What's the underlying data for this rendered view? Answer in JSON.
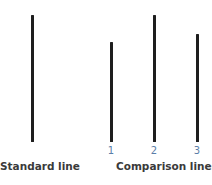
{
  "standard": {
    "caption": "Standard line",
    "line": {
      "x": 31,
      "top": 15,
      "bottom": 142
    }
  },
  "comparison": {
    "caption": "Comparison lines",
    "lines": [
      {
        "label": "1",
        "x": 110,
        "top": 42,
        "bottom": 142
      },
      {
        "label": "2",
        "x": 153,
        "top": 15,
        "bottom": 142
      },
      {
        "label": "3",
        "x": 196,
        "top": 34,
        "bottom": 142
      }
    ]
  },
  "colors": {
    "line": "#1e1e1e",
    "number": "#5a7ea8",
    "caption": "#3a3a3a"
  }
}
